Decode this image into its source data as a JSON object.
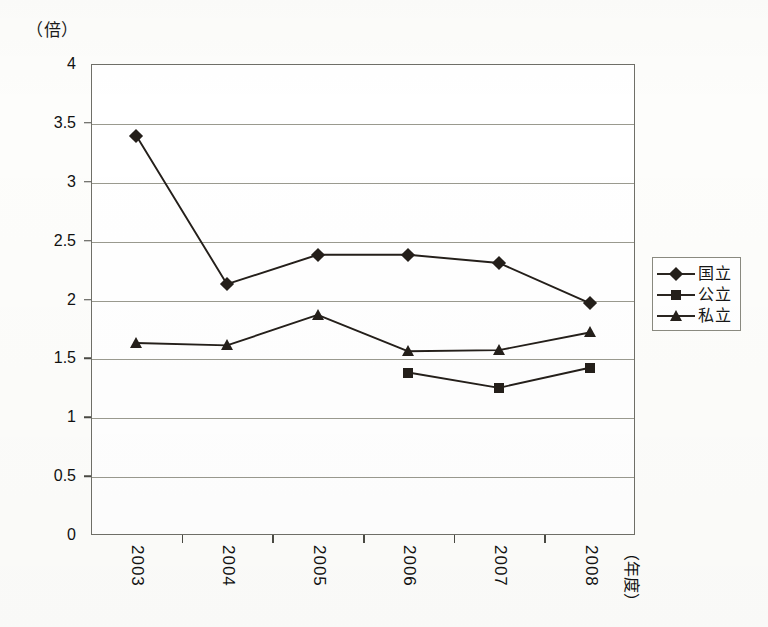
{
  "chart_data": {
    "type": "line",
    "title": "",
    "subtitle": "",
    "xlabel": "（年度）",
    "ylabel": "（倍）",
    "unit_label": "（倍）",
    "categories": [
      "2003",
      "2004",
      "2005",
      "2006",
      "2007",
      "2008"
    ],
    "ylim": [
      0,
      4
    ],
    "ytick_step": 0.5,
    "ytick_labels": [
      "4",
      "3.5",
      "3",
      "2.5",
      "2",
      "1.5",
      "1",
      "0.5",
      "0"
    ],
    "ytick_values": [
      4,
      3.5,
      3,
      2.5,
      2,
      1.5,
      1,
      0.5,
      0
    ],
    "grid": true,
    "legend_position": "right",
    "series": [
      {
        "name": "国立",
        "marker": "diamond",
        "color": "#241f1a",
        "values": [
          3.39,
          2.13,
          2.38,
          2.38,
          2.31,
          1.97
        ]
      },
      {
        "name": "公立",
        "marker": "square",
        "color": "#241f1a",
        "values": [
          null,
          null,
          null,
          1.38,
          1.25,
          1.42
        ]
      },
      {
        "name": "私立",
        "marker": "triangle",
        "color": "#241f1a",
        "values": [
          1.63,
          1.61,
          1.87,
          1.56,
          1.57,
          1.72
        ]
      }
    ]
  },
  "legend": {
    "items": [
      {
        "label": "国立",
        "marker": "diamond"
      },
      {
        "label": "公立",
        "marker": "square"
      },
      {
        "label": "私立",
        "marker": "triangle"
      }
    ]
  },
  "axes": {
    "x_title": "（年度）",
    "y_unit": "（倍）"
  },
  "colors": {
    "ink": "#241f1a",
    "grid": "#9a9a8f",
    "frame": "#6f6f68",
    "background": "#fdfdfb",
    "plot_background": "#ffffff"
  }
}
